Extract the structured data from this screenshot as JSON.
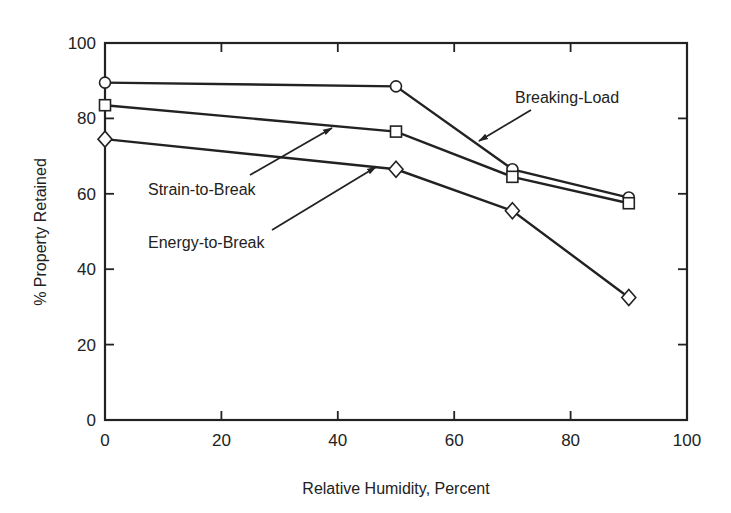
{
  "chart_data": {
    "type": "line",
    "title": "",
    "xlabel": "Relative Humidity, Percent",
    "ylabel": "% Property Retained",
    "xlim": [
      0,
      100
    ],
    "ylim": [
      0,
      100
    ],
    "xticks": [
      0,
      20,
      40,
      60,
      80,
      100
    ],
    "yticks": [
      0,
      20,
      40,
      60,
      80,
      100
    ],
    "grid": false,
    "legend": "inline annotations with arrows",
    "x": [
      0,
      50,
      70,
      90
    ],
    "series": [
      {
        "name": "Breaking-Load",
        "marker": "circle",
        "values": [
          89.5,
          88.5,
          66.5,
          59.0
        ]
      },
      {
        "name": "Strain-to-Break",
        "marker": "square",
        "values": [
          83.5,
          76.5,
          64.5,
          57.5
        ]
      },
      {
        "name": "Energy-to-Break",
        "marker": "diamond",
        "values": [
          74.5,
          66.5,
          55.5,
          32.5
        ]
      }
    ],
    "annotations": [
      {
        "text": "Breaking-Load",
        "points_to_series": "Breaking-Load"
      },
      {
        "text": "Strain-to-Break",
        "points_to_series": "Strain-to-Break"
      },
      {
        "text": "Energy-to-Break",
        "points_to_series": "Energy-to-Break"
      }
    ]
  },
  "style": {
    "line_color": "#222222",
    "marker_fill": "#ffffff",
    "background": "#ffffff"
  }
}
